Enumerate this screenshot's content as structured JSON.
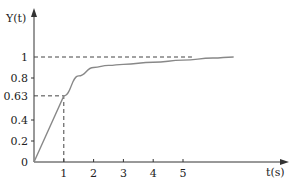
{
  "chart_data": {
    "type": "line",
    "title": "",
    "xlabel": "t(s)",
    "ylabel": "Y(t)",
    "xlim": [
      0,
      8.4
    ],
    "ylim": [
      0,
      1.0
    ],
    "x_ticks": [
      "1",
      "2",
      "3",
      "4",
      "5"
    ],
    "y_ticks": [
      "0",
      "0.2",
      "0.4",
      "0.63",
      "0.8",
      "1"
    ],
    "grid": false,
    "legend": null,
    "series": [
      {
        "name": "Y(t)",
        "x": [
          0,
          1,
          1.5,
          2,
          2.5,
          3,
          4,
          5,
          6,
          6.7
        ],
        "values": [
          0,
          0.63,
          0.82,
          0.9,
          0.92,
          0.93,
          0.95,
          0.97,
          0.99,
          1.0
        ]
      }
    ],
    "annotations": [
      {
        "type": "hline-dashed",
        "y": 1.0,
        "x_from": 0,
        "x_to": 5.3
      },
      {
        "type": "hline-dashed",
        "y": 0.63,
        "x_from": 0,
        "x_to": 1
      },
      {
        "type": "vline-dashed",
        "x": 1,
        "y_from": 0,
        "y_to": 0.63
      }
    ]
  }
}
